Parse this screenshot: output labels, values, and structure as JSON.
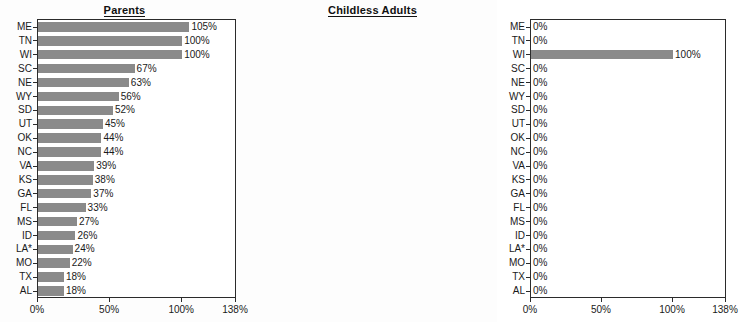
{
  "chart_data": [
    {
      "type": "bar",
      "orientation": "horizontal",
      "title": "Parents",
      "xlabel": "",
      "ylabel": "",
      "xlim": [
        0,
        138
      ],
      "xticks": [
        0,
        50,
        100,
        138
      ],
      "xtick_labels": [
        "0%",
        "50%",
        "100%",
        "138%"
      ],
      "grid": false,
      "legend": "none",
      "categories": [
        "ME",
        "TN",
        "WI",
        "SC",
        "NE",
        "WY",
        "SD",
        "UT",
        "OK",
        "NC",
        "VA",
        "KS",
        "GA",
        "FL",
        "MS",
        "ID",
        "LA*",
        "MO",
        "TX",
        "AL"
      ],
      "values": [
        105,
        100,
        100,
        67,
        63,
        56,
        52,
        45,
        44,
        44,
        39,
        38,
        37,
        33,
        27,
        26,
        24,
        22,
        18,
        18
      ],
      "value_labels": [
        "105%",
        "100%",
        "100%",
        "67%",
        "63%",
        "56%",
        "52%",
        "45%",
        "44%",
        "44%",
        "39%",
        "38%",
        "37%",
        "33%",
        "27%",
        "26%",
        "24%",
        "22%",
        "18%",
        "18%"
      ]
    },
    {
      "type": "bar",
      "orientation": "horizontal",
      "title": "Childless Adults",
      "xlabel": "",
      "ylabel": "",
      "xlim": [
        0,
        138
      ],
      "xticks": [
        0,
        50,
        100,
        138
      ],
      "xtick_labels": [
        "0%",
        "50%",
        "100%",
        "138%"
      ],
      "grid": false,
      "legend": "none",
      "categories": [
        "ME",
        "TN",
        "WI",
        "SC",
        "NE",
        "WY",
        "SD",
        "UT",
        "OK",
        "NC",
        "VA",
        "KS",
        "GA",
        "FL",
        "MS",
        "ID",
        "LA*",
        "MO",
        "TX",
        "AL"
      ],
      "values": [
        0,
        0,
        100,
        0,
        0,
        0,
        0,
        0,
        0,
        0,
        0,
        0,
        0,
        0,
        0,
        0,
        0,
        0,
        0,
        0
      ],
      "value_labels": [
        "0%",
        "0%",
        "100%",
        "0%",
        "0%",
        "0%",
        "0%",
        "0%",
        "0%",
        "0%",
        "0%",
        "0%",
        "0%",
        "0%",
        "0%",
        "0%",
        "0%",
        "0%",
        "0%",
        "0%"
      ]
    }
  ],
  "colors": {
    "bar": "#8a8a8a",
    "axis": "#2b2b2b",
    "text": "#1a1a1a",
    "background": "#ffffff"
  }
}
